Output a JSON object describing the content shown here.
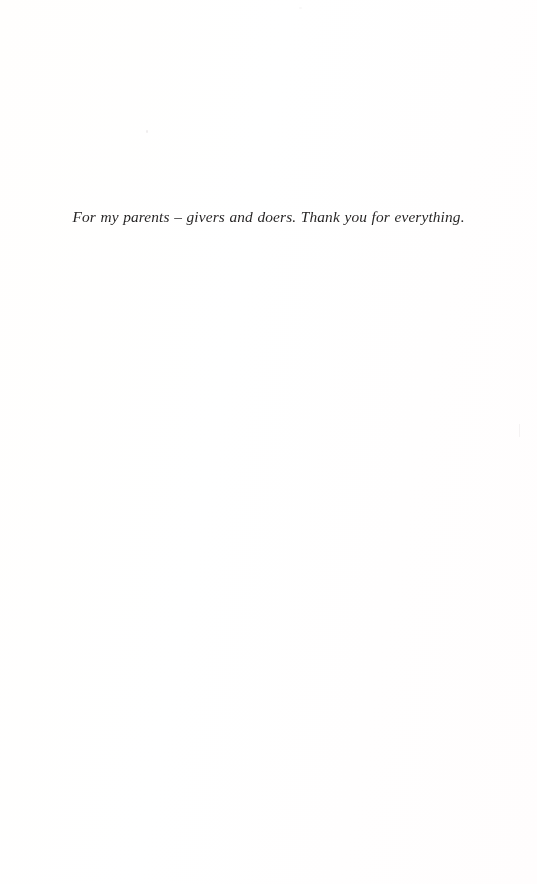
{
  "page": {
    "kind": "book-dedication-page",
    "width": 537,
    "height": 884,
    "background_color": "#fffefe",
    "text_color": "#1d1b1b"
  },
  "dedication": {
    "text": "For my parents – givers and doers. Thank you for everything.",
    "style": "italic-serif",
    "alignment": "centered"
  },
  "artifacts": {
    "speck_upper_left": "scan-speck",
    "speck_top_edge": "scan-speck",
    "right_edge_mark": "scan-edge-artifact"
  }
}
